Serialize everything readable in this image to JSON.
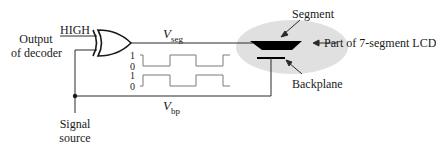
{
  "labels": {
    "input_label_line1": "Output",
    "input_label_line2": "of decoder",
    "high": "HIGH",
    "vseg_main": "V",
    "vseg_sub": "seg",
    "vbp_main": "V",
    "vbp_sub": "bp",
    "segment": "Segment",
    "part_of_lcd": "Part of 7-segment LCD",
    "backplane": "Backplane",
    "signal_line1": "Signal",
    "signal_line2": "source"
  },
  "waveform_levels": {
    "top_high": "1",
    "top_low": "0",
    "bottom_high": "1",
    "bottom_low": "0"
  },
  "colors": {
    "line": "#2a2a2a",
    "wave": "#7a7a7a",
    "lcd_bg": "#e0e0e0",
    "segment": "#000000"
  }
}
